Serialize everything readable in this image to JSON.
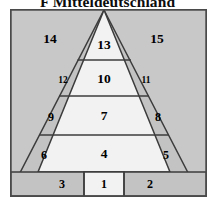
{
  "title": "F  Mitteldeutschland",
  "colors": {
    "frame_border": "#4a4a4a",
    "outer_fill": "#c8c8c8",
    "band_fill": "#c0c0c0",
    "core_fill": "#f2f2f2",
    "line": "#3c3c3c",
    "label": "#000000",
    "page_background": "#ffffff"
  },
  "diagram": {
    "type": "layered-pyramid",
    "frame": {
      "x": 0,
      "y": 0,
      "width": 197,
      "height": 188
    },
    "apex": {
      "x": 94,
      "y": 1
    },
    "tier_dividers_y": [
      51,
      87,
      126,
      163
    ],
    "bottom_row_dividers_x": [
      74,
      114
    ],
    "regions": [
      {
        "id": "r1",
        "label": "1",
        "zone": "base-row",
        "fill": "core",
        "cx": 94,
        "cy": 175,
        "size": "med"
      },
      {
        "id": "r2",
        "label": "2",
        "zone": "base-row",
        "fill": "band",
        "cx": 140,
        "cy": 175,
        "size": "med"
      },
      {
        "id": "r3",
        "label": "3",
        "zone": "base-row",
        "fill": "band",
        "cx": 52,
        "cy": 175,
        "size": "med"
      },
      {
        "id": "r4",
        "label": "4",
        "zone": "core-tier-4",
        "fill": "core",
        "cx": 94,
        "cy": 145,
        "size": "big"
      },
      {
        "id": "r5",
        "label": "5",
        "zone": "band-right-4",
        "fill": "band",
        "cx": 156,
        "cy": 146,
        "size": "med"
      },
      {
        "id": "r6",
        "label": "6",
        "zone": "band-left-4",
        "fill": "band",
        "cx": 34,
        "cy": 146,
        "size": "med"
      },
      {
        "id": "r7",
        "label": "7",
        "zone": "core-tier-3",
        "fill": "core",
        "cx": 94,
        "cy": 107,
        "size": "big"
      },
      {
        "id": "r8",
        "label": "8",
        "zone": "band-right-3",
        "fill": "band",
        "cx": 148,
        "cy": 108,
        "size": "med"
      },
      {
        "id": "r9",
        "label": "9",
        "zone": "band-left-3",
        "fill": "band",
        "cx": 41,
        "cy": 108,
        "size": "med"
      },
      {
        "id": "r10",
        "label": "10",
        "zone": "core-tier-2",
        "fill": "core",
        "cx": 94,
        "cy": 70,
        "size": "big"
      },
      {
        "id": "r11",
        "label": "11",
        "zone": "band-right-2",
        "fill": "band",
        "cx": 136,
        "cy": 72,
        "size": "small"
      },
      {
        "id": "r12",
        "label": "12",
        "zone": "band-left-2",
        "fill": "band",
        "cx": 53,
        "cy": 72,
        "size": "small"
      },
      {
        "id": "r13",
        "label": "13",
        "zone": "core-tier-1",
        "fill": "core",
        "cx": 94,
        "cy": 36,
        "size": "big"
      },
      {
        "id": "r14",
        "label": "14",
        "zone": "outer-left",
        "fill": "outer",
        "cx": 40,
        "cy": 30,
        "size": "big"
      },
      {
        "id": "r15",
        "label": "15",
        "zone": "outer-right",
        "fill": "outer",
        "cx": 147,
        "cy": 30,
        "size": "big"
      }
    ]
  }
}
